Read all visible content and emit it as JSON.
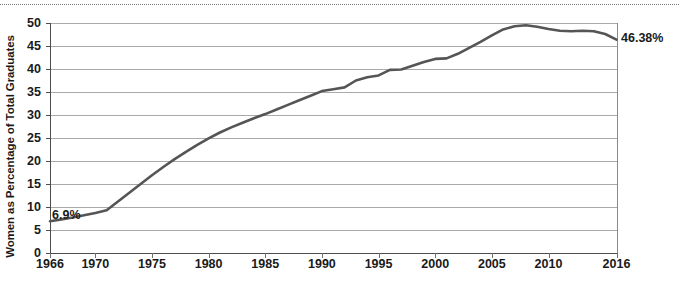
{
  "chart_data": {
    "type": "line",
    "title": "",
    "xlabel": "",
    "ylabel": "Women as Percentage of Total Graduates",
    "xlim": [
      1966,
      2016
    ],
    "ylim": [
      0,
      50
    ],
    "grid": true,
    "legend": "none",
    "line_color": "#555555",
    "x_tick_labels": [
      "1966",
      "1970",
      "1975",
      "1980",
      "1985",
      "1990",
      "1995",
      "2000",
      "2005",
      "2010",
      "2016"
    ],
    "x_ticks": [
      1966,
      1970,
      1975,
      1980,
      1985,
      1990,
      1995,
      2000,
      2005,
      2010,
      2016
    ],
    "y_tick_labels": [
      "0",
      "5",
      "10",
      "15",
      "20",
      "25",
      "30",
      "35",
      "40",
      "45",
      "50"
    ],
    "y_ticks": [
      0,
      5,
      10,
      15,
      20,
      25,
      30,
      35,
      40,
      45,
      50
    ],
    "annotations": [
      {
        "name": "start-value",
        "text": "6.9%",
        "x": 1966,
        "y": 6.9
      },
      {
        "name": "end-value",
        "text": "46.38%",
        "x": 2016,
        "y": 46.38
      }
    ],
    "x": [
      1966,
      1967,
      1968,
      1969,
      1970,
      1971,
      1972,
      1973,
      1974,
      1975,
      1976,
      1977,
      1978,
      1979,
      1980,
      1981,
      1982,
      1983,
      1984,
      1985,
      1986,
      1987,
      1988,
      1989,
      1990,
      1991,
      1992,
      1993,
      1994,
      1995,
      1996,
      1997,
      1998,
      1999,
      2000,
      2001,
      2002,
      2003,
      2004,
      2005,
      2006,
      2007,
      2008,
      2009,
      2010,
      2011,
      2012,
      2013,
      2014,
      2015,
      2016
    ],
    "values": [
      6.9,
      7.3,
      7.7,
      8.2,
      8.7,
      9.3,
      11.2,
      13.1,
      15.0,
      16.9,
      18.7,
      20.4,
      22.0,
      23.5,
      24.9,
      26.2,
      27.3,
      28.3,
      29.3,
      30.2,
      31.2,
      32.2,
      33.2,
      34.2,
      35.2,
      35.6,
      36.0,
      37.5,
      38.2,
      38.6,
      39.8,
      39.9,
      40.7,
      41.5,
      42.2,
      42.3,
      43.3,
      44.6,
      45.9,
      47.3,
      48.6,
      49.3,
      49.5,
      49.2,
      48.7,
      48.3,
      48.2,
      48.3,
      48.2,
      47.6,
      46.38
    ],
    "series": [
      {
        "name": "Women as Percentage of Total Graduates",
        "values": [
          6.9,
          7.3,
          7.7,
          8.2,
          8.7,
          9.3,
          11.2,
          13.1,
          15.0,
          16.9,
          18.7,
          20.4,
          22.0,
          23.5,
          24.9,
          26.2,
          27.3,
          28.3,
          29.3,
          30.2,
          31.2,
          32.2,
          33.2,
          34.2,
          35.2,
          35.6,
          36.0,
          37.5,
          38.2,
          38.6,
          39.8,
          39.9,
          40.7,
          41.5,
          42.2,
          42.3,
          43.3,
          44.6,
          45.9,
          47.3,
          48.6,
          49.3,
          49.5,
          49.2,
          48.7,
          48.3,
          48.2,
          48.3,
          48.2,
          47.6,
          46.38
        ]
      }
    ]
  }
}
